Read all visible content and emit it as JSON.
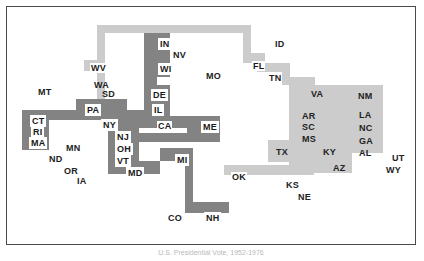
{
  "figure": {
    "type": "staircase-band-map",
    "caption": "U.S. Presidential Vote, 1952-1976",
    "background_color": "#ffffff",
    "frame_color": "#4a4a4a",
    "band_light_color": "#cccccc",
    "band_dark_color": "#838383",
    "label_box_color": "#ffffff",
    "label_text_color": "#1a1a1a"
  },
  "chart_data": {
    "type": "diagram",
    "title": "U.S. Presidential Vote, 1952-1976",
    "bands": [
      {
        "name": "upper-light-path",
        "shade": "light"
      },
      {
        "name": "central-dark-path",
        "shade": "dark"
      },
      {
        "name": "right-light-path",
        "shade": "light"
      }
    ],
    "label_groups": [
      {
        "style": "boxed-on-dark",
        "labels": [
          "IN",
          "WI",
          "DE",
          "IL",
          "CT",
          "RI",
          "MA",
          "PA",
          "NY",
          "NJ",
          "OH",
          "VT",
          "MD",
          "ME",
          "MI",
          "NH"
        ]
      },
      {
        "style": "boxed-on-light",
        "labels": [
          "WV",
          "FL",
          "OK"
        ]
      },
      {
        "style": "plain-on-light",
        "labels": [
          "TN",
          "VA",
          "AR",
          "SC",
          "MS",
          "TX",
          "KY",
          "AZ",
          "NM",
          "LA",
          "NC",
          "GA",
          "AL"
        ]
      },
      {
        "style": "plain-on-white",
        "labels": [
          "NV",
          "MO",
          "ID",
          "MT",
          "WA",
          "SD",
          "MN",
          "ND",
          "OR",
          "IA",
          "CO",
          "KS",
          "NE",
          "UT",
          "WY"
        ]
      }
    ]
  },
  "labels": [
    {
      "text": "IN",
      "style": "boxed",
      "x": 158,
      "y": 38
    },
    {
      "text": "NV",
      "style": "plain",
      "x": 172,
      "y": 50
    },
    {
      "text": "WI",
      "style": "boxed",
      "x": 158,
      "y": 63
    },
    {
      "text": "WV",
      "style": "boxedlight",
      "x": 90,
      "y": 63
    },
    {
      "text": "MO",
      "style": "plain",
      "x": 205,
      "y": 71
    },
    {
      "text": "ID",
      "style": "plain",
      "x": 274,
      "y": 39
    },
    {
      "text": "FL",
      "style": "boxedlight",
      "x": 252,
      "y": 61
    },
    {
      "text": "TN",
      "style": "onlight",
      "x": 268,
      "y": 73
    },
    {
      "text": "WA",
      "style": "plain",
      "x": 93,
      "y": 80
    },
    {
      "text": "MT",
      "style": "plain",
      "x": 37,
      "y": 87
    },
    {
      "text": "SD",
      "style": "plain",
      "x": 101,
      "y": 89
    },
    {
      "text": "DE",
      "style": "boxed",
      "x": 151,
      "y": 89
    },
    {
      "text": "VA",
      "style": "onlight",
      "x": 310,
      "y": 89
    },
    {
      "text": "NM",
      "style": "onlight",
      "x": 357,
      "y": 91
    },
    {
      "text": "IL",
      "style": "boxed",
      "x": 152,
      "y": 104
    },
    {
      "text": "PA",
      "style": "boxed",
      "x": 85,
      "y": 104
    },
    {
      "text": "LA",
      "style": "onlight",
      "x": 358,
      "y": 110
    },
    {
      "text": "AR",
      "style": "onlight",
      "x": 301,
      "y": 111
    },
    {
      "text": "CT",
      "style": "boxed",
      "x": 30,
      "y": 115
    },
    {
      "text": "NY",
      "style": "boxed",
      "x": 101,
      "y": 119
    },
    {
      "text": "CA",
      "style": "boxedlight",
      "x": 157,
      "y": 121
    },
    {
      "text": "ME",
      "style": "boxed",
      "x": 201,
      "y": 121
    },
    {
      "text": "SC",
      "style": "onlight",
      "x": 301,
      "y": 122
    },
    {
      "text": "NC",
      "style": "onlight",
      "x": 358,
      "y": 123
    },
    {
      "text": "RI",
      "style": "boxed",
      "x": 31,
      "y": 126
    },
    {
      "text": "NJ",
      "style": "boxed",
      "x": 115,
      "y": 131
    },
    {
      "text": "MA",
      "style": "boxed",
      "x": 29,
      "y": 137
    },
    {
      "text": "GA",
      "style": "onlight",
      "x": 358,
      "y": 136
    },
    {
      "text": "MS",
      "style": "onlight",
      "x": 301,
      "y": 134
    },
    {
      "text": "OH",
      "style": "boxed",
      "x": 115,
      "y": 143
    },
    {
      "text": "MN",
      "style": "plain",
      "x": 65,
      "y": 143
    },
    {
      "text": "AL",
      "style": "onlight",
      "x": 358,
      "y": 148
    },
    {
      "text": "TX",
      "style": "onlight",
      "x": 275,
      "y": 147
    },
    {
      "text": "KY",
      "style": "onlight",
      "x": 322,
      "y": 147
    },
    {
      "text": "ND",
      "style": "plain",
      "x": 48,
      "y": 154
    },
    {
      "text": "VT",
      "style": "boxed",
      "x": 115,
      "y": 155
    },
    {
      "text": "MI",
      "style": "boxed",
      "x": 175,
      "y": 154
    },
    {
      "text": "UT",
      "style": "plain",
      "x": 391,
      "y": 153
    },
    {
      "text": "OR",
      "style": "plain",
      "x": 63,
      "y": 166
    },
    {
      "text": "MD",
      "style": "boxed",
      "x": 126,
      "y": 167
    },
    {
      "text": "AZ",
      "style": "onlight",
      "x": 332,
      "y": 163
    },
    {
      "text": "WY",
      "style": "plain",
      "x": 385,
      "y": 165
    },
    {
      "text": "IA",
      "style": "plain",
      "x": 76,
      "y": 176
    },
    {
      "text": "OK",
      "style": "boxedlight",
      "x": 231,
      "y": 172
    },
    {
      "text": "KS",
      "style": "plain",
      "x": 285,
      "y": 180
    },
    {
      "text": "NE",
      "style": "plain",
      "x": 297,
      "y": 192
    },
    {
      "text": "CO",
      "style": "plain",
      "x": 167,
      "y": 213
    },
    {
      "text": "NH",
      "style": "boxed",
      "x": 204,
      "y": 212
    }
  ],
  "bands": [
    {
      "shade": "light",
      "x": 97,
      "y": 25,
      "w": 154,
      "h": 8
    },
    {
      "shade": "light",
      "x": 243,
      "y": 25,
      "w": 8,
      "h": 28
    },
    {
      "shade": "light",
      "x": 97,
      "y": 25,
      "w": 8,
      "h": 74
    },
    {
      "shade": "light",
      "x": 84,
      "y": 60,
      "w": 21,
      "h": 11
    },
    {
      "shade": "light",
      "x": 84,
      "y": 99,
      "w": 21,
      "h": 11
    },
    {
      "shade": "light",
      "x": 243,
      "y": 53,
      "w": 22,
      "h": 10
    },
    {
      "shade": "light",
      "x": 257,
      "y": 53,
      "w": 8,
      "h": 18
    },
    {
      "shade": "light",
      "x": 257,
      "y": 63,
      "w": 33,
      "h": 9
    },
    {
      "shade": "light",
      "x": 282,
      "y": 63,
      "w": 8,
      "h": 22
    },
    {
      "shade": "light",
      "x": 282,
      "y": 77,
      "w": 33,
      "h": 8
    },
    {
      "shade": "light",
      "x": 289,
      "y": 77,
      "w": 26,
      "h": 23
    },
    {
      "shade": "light",
      "x": 289,
      "y": 85,
      "w": 63,
      "h": 78
    },
    {
      "shade": "light",
      "x": 349,
      "y": 85,
      "w": 34,
      "h": 68
    },
    {
      "shade": "light",
      "x": 268,
      "y": 140,
      "w": 84,
      "h": 22
    },
    {
      "shade": "light",
      "x": 289,
      "y": 155,
      "w": 63,
      "h": 18
    },
    {
      "shade": "light",
      "x": 224,
      "y": 165,
      "w": 90,
      "h": 10
    },
    {
      "shade": "dark",
      "x": 144,
      "y": 33,
      "w": 26,
      "h": 44
    },
    {
      "shade": "dark",
      "x": 144,
      "y": 77,
      "w": 13,
      "h": 8
    },
    {
      "shade": "dark",
      "x": 144,
      "y": 85,
      "w": 26,
      "h": 31
    },
    {
      "shade": "dark",
      "x": 22,
      "y": 110,
      "w": 27,
      "h": 40
    },
    {
      "shade": "dark",
      "x": 22,
      "y": 110,
      "w": 105,
      "h": 10
    },
    {
      "shade": "dark",
      "x": 76,
      "y": 99,
      "w": 51,
      "h": 21
    },
    {
      "shade": "dark",
      "x": 108,
      "y": 110,
      "w": 39,
      "h": 18
    },
    {
      "shade": "dark",
      "x": 108,
      "y": 116,
      "w": 62,
      "h": 12
    },
    {
      "shade": "dark",
      "x": 108,
      "y": 126,
      "w": 31,
      "h": 48
    },
    {
      "shade": "dark",
      "x": 170,
      "y": 116,
      "w": 50,
      "h": 12
    },
    {
      "shade": "dark",
      "x": 187,
      "y": 116,
      "w": 33,
      "h": 22
    },
    {
      "shade": "dark",
      "x": 108,
      "y": 133,
      "w": 112,
      "h": 9
    },
    {
      "shade": "dark",
      "x": 108,
      "y": 142,
      "w": 31,
      "h": 32
    },
    {
      "shade": "dark",
      "x": 125,
      "y": 161,
      "w": 35,
      "h": 13
    },
    {
      "shade": "dark",
      "x": 160,
      "y": 148,
      "w": 33,
      "h": 13
    },
    {
      "shade": "dark",
      "x": 185,
      "y": 148,
      "w": 8,
      "h": 62
    },
    {
      "shade": "dark",
      "x": 185,
      "y": 202,
      "w": 44,
      "h": 11
    }
  ]
}
